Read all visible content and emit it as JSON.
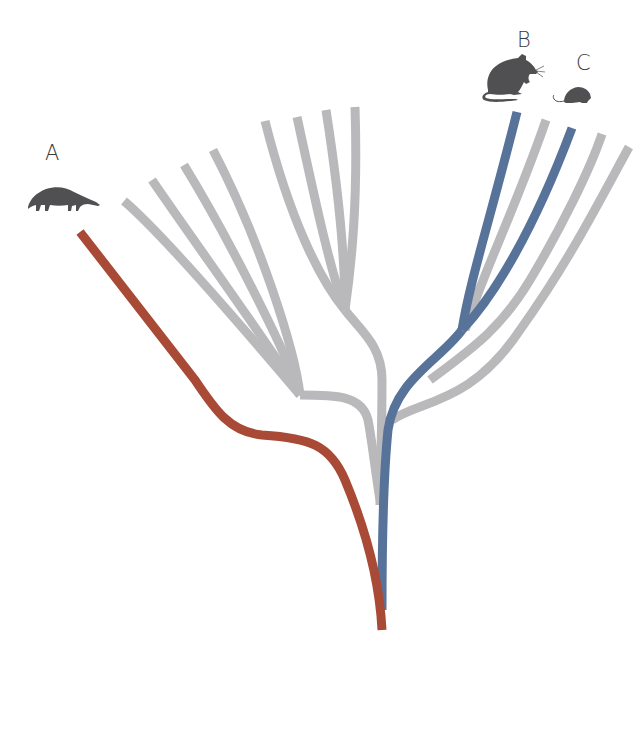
{
  "labels": {
    "a": "A",
    "b": "B",
    "c": "C"
  },
  "icons": {
    "a": "anteater-silhouette-icon",
    "b": "rat-silhouette-icon",
    "c": "mouse-silhouette-icon"
  },
  "colors": {
    "background": "#ffffff",
    "gray_branch": "#b9b9bb",
    "red_lineage": "#a84a35",
    "blue_lineage": "#58739a",
    "root_blend": "#5a3d45",
    "silhouette": "#505052",
    "label": "#3a3a3a"
  },
  "diagram": {
    "type": "phylogenetic-tree",
    "highlighted_lineages": [
      {
        "tip": "A",
        "color_key": "red_lineage"
      },
      {
        "tip": "B",
        "color_key": "blue_lineage"
      },
      {
        "tip": "C",
        "color_key": "blue_lineage"
      }
    ],
    "gray_tip_count": 11
  }
}
